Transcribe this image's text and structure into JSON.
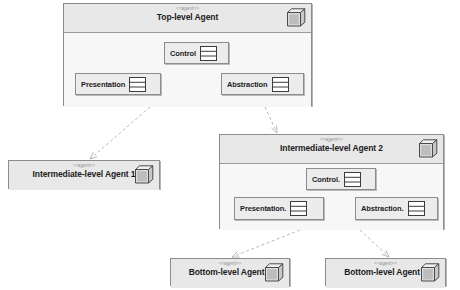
{
  "diagram": {
    "background": "#ffffff",
    "stereotype": "<<agent>>",
    "colors": {
      "header_fill": "#e8e8e8",
      "body_fill": "#f7f7f7",
      "subcomp_fill": "#ececec",
      "border": "#8c8c8c",
      "link": "#b9b9b9",
      "text": "#1c1c1c",
      "stereotype_text": "#8e8e8e"
    }
  },
  "agents": [
    {
      "id": "top-level-agent",
      "stereotype": "<<agent>>",
      "name": "Top-level Agent",
      "collapsed": false,
      "x": 63,
      "y": 3,
      "w": 249,
      "h": 103,
      "components": [
        {
          "id": "control",
          "label": "Control",
          "x": 100,
          "y": 38,
          "w": 65,
          "h": 22
        },
        {
          "id": "presentation",
          "label": "Presentation",
          "x": 11,
          "y": 69,
          "w": 86,
          "h": 22
        },
        {
          "id": "abstraction",
          "label": "Abstraction",
          "x": 157,
          "y": 69,
          "w": 83,
          "h": 22
        }
      ]
    },
    {
      "id": "intermediate-level-agent-1",
      "stereotype": "<<agent>>",
      "name": "Intermediate-level Agent 1",
      "collapsed": true,
      "x": 8,
      "y": 160,
      "w": 152,
      "h": 29,
      "components": []
    },
    {
      "id": "intermediate-level-agent-2",
      "stereotype": "<<agent>>",
      "name": "Intermediate-level Agent 2",
      "collapsed": false,
      "x": 219,
      "y": 134,
      "w": 225,
      "h": 95,
      "components": [
        {
          "id": "control",
          "label": "Control.",
          "x": 86,
          "y": 33,
          "w": 70,
          "h": 22
        },
        {
          "id": "presentation",
          "label": "Presentation.",
          "x": 14,
          "y": 62,
          "w": 90,
          "h": 23
        },
        {
          "id": "abstraction",
          "label": "Abstraction.",
          "x": 135,
          "y": 62,
          "w": 83,
          "h": 23
        }
      ]
    },
    {
      "id": "bottom-level-agent-1",
      "stereotype": "<<agent>>",
      "name": "Bottom-level Agent 1",
      "collapsed": true,
      "x": 170,
      "y": 258,
      "w": 120,
      "h": 28,
      "components": []
    },
    {
      "id": "bottom-level-agent-2",
      "stereotype": "<<agent>>",
      "name": "Bottom-level Agent 2",
      "collapsed": true,
      "x": 325,
      "y": 258,
      "w": 121,
      "h": 28,
      "components": []
    }
  ],
  "links": [
    {
      "id": "top-to-intermediate-1",
      "from": "top-level-agent",
      "to": "intermediate-level-agent-1",
      "x1": 150,
      "y1": 107,
      "x2": 90,
      "y2": 159
    },
    {
      "id": "top-to-intermediate-2",
      "from": "top-level-agent",
      "to": "intermediate-level-agent-2",
      "x1": 265,
      "y1": 107,
      "x2": 277,
      "y2": 133
    },
    {
      "id": "intermediate-2-to-bottom-1",
      "from": "intermediate-level-agent-2",
      "to": "bottom-level-agent-1",
      "x1": 300,
      "y1": 230,
      "x2": 232,
      "y2": 257
    },
    {
      "id": "intermediate-2-to-bottom-2",
      "from": "intermediate-level-agent-2",
      "to": "bottom-level-agent-2",
      "x1": 360,
      "y1": 230,
      "x2": 389,
      "y2": 257
    }
  ]
}
